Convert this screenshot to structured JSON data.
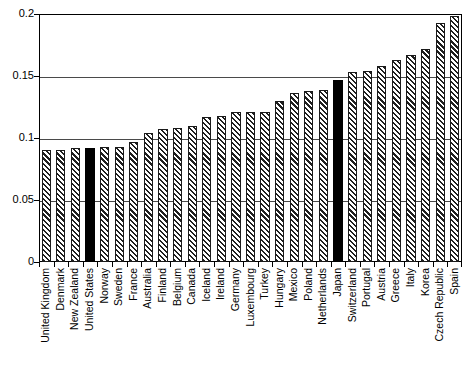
{
  "chart_data": {
    "type": "bar",
    "title": "",
    "subtitle": "",
    "xlabel": "",
    "ylabel": "",
    "ylim": [
      0,
      0.2
    ],
    "yticks": [
      0,
      0.05,
      0.1,
      0.15,
      0.2
    ],
    "ytick_labels": [
      "0",
      "0.05",
      "0.1",
      "0.15",
      "0.2"
    ],
    "grid": true,
    "legend": null,
    "categories": [
      "United Kingdom",
      "Denmark",
      "New Zealand",
      "United States",
      "Norway",
      "Sweden",
      "France",
      "Australia",
      "Finland",
      "Belgium",
      "Canada",
      "Iceland",
      "Ireland",
      "Germany",
      "Luxembourg",
      "Turkey",
      "Hungary",
      "Mexico",
      "Poland",
      "Netherlands",
      "Japan",
      "Switzerland",
      "Portugal",
      "Austria",
      "Greece",
      "Italy",
      "Korea",
      "Czech Republic",
      "Spain"
    ],
    "values": [
      0.09,
      0.09,
      0.092,
      0.092,
      0.093,
      0.093,
      0.097,
      0.104,
      0.107,
      0.108,
      0.11,
      0.117,
      0.118,
      0.121,
      0.121,
      0.121,
      0.13,
      0.136,
      0.138,
      0.139,
      0.147,
      0.153,
      0.154,
      0.158,
      0.163,
      0.167,
      0.172,
      0.193,
      0.198
    ],
    "highlighted": [
      "United States",
      "Japan"
    ],
    "bar_styles": {
      "default": "hatched",
      "highlight": "solid-black"
    },
    "colors": {
      "bar_fill": "#ffffff",
      "bar_hatch": "#1f1f1f",
      "bar_edge": "#1a1a1a",
      "highlight_fill": "#000000",
      "axis": "#000000",
      "gridline": "#4a4a4a",
      "background": "#ffffff"
    }
  }
}
